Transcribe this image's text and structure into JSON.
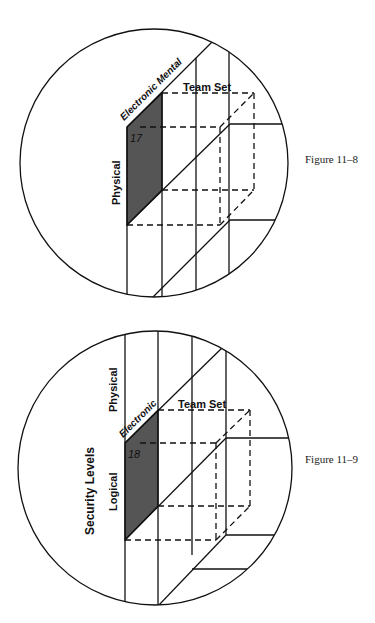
{
  "figures": [
    {
      "caption": "Figure 11–8",
      "labels": {
        "axis_top": "Electronic Mental",
        "team_set": "Team Set",
        "left_axis": "Physical",
        "cell_number": "17"
      }
    },
    {
      "caption": "Figure 11–9",
      "labels": {
        "axis_top": "Electronic",
        "team_set": "Team Set",
        "upper_left_axis": "Physical",
        "left_axis": "Logical",
        "outer_axis": "Security Levels",
        "cell_number": "18"
      }
    }
  ],
  "colors": {
    "line": "#111111",
    "shaded_cell": "#555555",
    "background": "#ffffff"
  }
}
